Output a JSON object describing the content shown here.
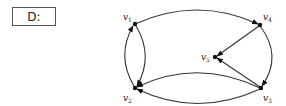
{
  "graph": {
    "name": "D:",
    "vertices": [
      {
        "id": "v1",
        "label": "v",
        "sub": "1",
        "x": 135,
        "y": 24,
        "lx": 123,
        "ly": 20
      },
      {
        "id": "v2",
        "label": "v",
        "sub": "2",
        "x": 135,
        "y": 88,
        "lx": 123,
        "ly": 101
      },
      {
        "id": "v3",
        "label": "v",
        "sub": "3",
        "x": 261,
        "y": 88,
        "lx": 263,
        "ly": 101
      },
      {
        "id": "v4",
        "label": "v",
        "sub": "4",
        "x": 260,
        "y": 25,
        "lx": 263,
        "ly": 20
      },
      {
        "id": "v5",
        "label": "v",
        "sub": "5",
        "x": 215,
        "y": 57,
        "lx": 201,
        "ly": 60
      }
    ],
    "edges": [
      {
        "from": "v1",
        "to": "v4",
        "shape": "top-arc"
      },
      {
        "from": "v2",
        "to": "v1",
        "shape": "lens-left"
      },
      {
        "from": "v1",
        "to": "v2",
        "shape": "lens-right"
      },
      {
        "from": "v4",
        "to": "v5",
        "shape": "straight"
      },
      {
        "from": "v3",
        "to": "v5",
        "shape": "straight"
      },
      {
        "from": "v4",
        "to": "v3",
        "shape": "right-arc"
      },
      {
        "from": "v3",
        "to": "v2",
        "shape": "bottom-upper-arc"
      },
      {
        "from": "v3",
        "to": "v2",
        "shape": "bottom-lower-arc"
      }
    ]
  }
}
